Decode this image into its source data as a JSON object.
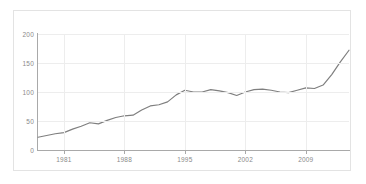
{
  "chart_data": {
    "type": "line",
    "title": "",
    "subtitle": "",
    "xlabel": "",
    "ylabel": "",
    "xlim": [
      1978,
      2014
    ],
    "ylim": [
      0,
      200
    ],
    "grid": true,
    "legend": false,
    "legend_position": "none",
    "line_color": "#7f7f7f",
    "grid_color": "#ededed",
    "axis_color": "#a9a9a9",
    "tick_label_color": "#8a8a8a",
    "background_color": "#ffffff",
    "frame_color": "#e3e3e3",
    "y_ticks": [
      0,
      50,
      100,
      150,
      200
    ],
    "y_tick_labels": [
      "0",
      "50",
      "100",
      "150",
      "200"
    ],
    "x_ticks": [
      1981,
      1988,
      1995,
      2002,
      2009
    ],
    "x_tick_labels": [
      "1981",
      "1988",
      "1995",
      "2002",
      "2009"
    ],
    "series": [
      {
        "name": "series-1",
        "x": [
          1978,
          1979,
          1980,
          1981,
          1982,
          1983,
          1984,
          1985,
          1986,
          1987,
          1988,
          1989,
          1990,
          1991,
          1992,
          1993,
          1994,
          1995,
          1996,
          1997,
          1998,
          1999,
          2000,
          2001,
          2002,
          2003,
          2004,
          2005,
          2006,
          2007,
          2008,
          2009,
          2010,
          2011,
          2012,
          2013,
          2014
        ],
        "values": [
          22,
          25,
          28,
          30,
          36,
          41,
          47,
          45,
          51,
          56,
          59,
          60,
          69,
          76,
          78,
          83,
          95,
          103,
          100,
          100,
          104,
          102,
          99,
          94,
          100,
          104,
          105,
          103,
          100,
          99,
          103,
          107,
          106,
          112,
          130,
          152,
          172
        ]
      }
    ]
  }
}
